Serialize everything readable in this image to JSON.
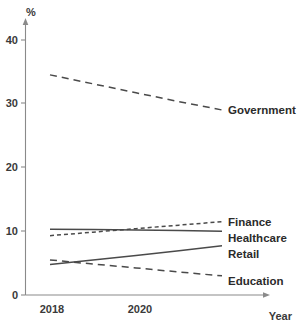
{
  "chart_data": {
    "type": "line",
    "title": "",
    "subtitle": "",
    "xlabel": "Year",
    "ylabel": "%",
    "x": [
      2018,
      2019,
      2020,
      2021,
      2022
    ],
    "xlim": [
      2018,
      2022
    ],
    "ylim": [
      0,
      43
    ],
    "xticks": [
      "2018",
      "2020"
    ],
    "xtick_values": [
      2018,
      2020
    ],
    "yticks": [
      "0",
      "10",
      "20",
      "30",
      "40"
    ],
    "ytick_values": [
      0,
      10,
      20,
      30,
      40
    ],
    "grid": false,
    "legend_position": "right-inline-labels",
    "series": [
      {
        "name": "Government",
        "style": "dashed-long",
        "values": [
          34.5,
          33.1,
          31.7,
          30.3,
          29.0
        ],
        "label": "Government"
      },
      {
        "name": "Finance",
        "style": "dashed-short",
        "values": [
          9.3,
          9.85,
          10.4,
          10.95,
          11.5
        ],
        "label": "Finance"
      },
      {
        "name": "Healthcare",
        "style": "solid",
        "values": [
          10.3,
          10.25,
          10.2,
          10.1,
          10.0
        ],
        "label": "Healthcare"
      },
      {
        "name": "Retail",
        "style": "solid",
        "values": [
          4.8,
          5.5,
          6.2,
          6.95,
          7.7
        ],
        "label": "Retail"
      },
      {
        "name": "Education",
        "style": "dashed-long",
        "values": [
          5.5,
          4.85,
          4.25,
          3.6,
          3.0
        ],
        "label": "Education"
      }
    ]
  },
  "axes": {
    "y_axis_title": "%",
    "x_axis_title": "Year",
    "y_tick_labels": [
      "40",
      "30",
      "20",
      "10",
      "0"
    ],
    "x_tick_labels": [
      "2018",
      "2020"
    ]
  },
  "labels": {
    "government": "Government",
    "finance": "Finance",
    "healthcare": "Healthcare",
    "retail": "Retail",
    "education": "Education"
  }
}
